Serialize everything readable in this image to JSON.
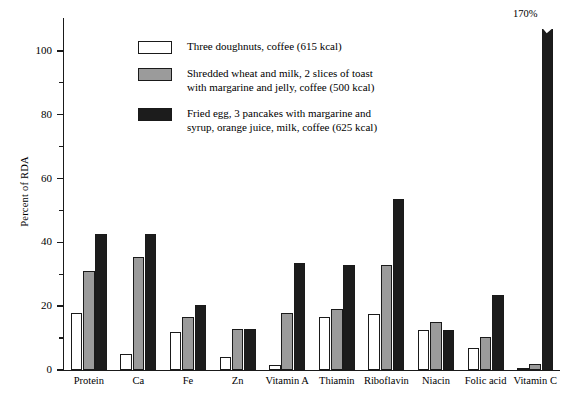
{
  "chart_data": {
    "type": "bar",
    "title": "",
    "xlabel": "",
    "ylabel": "Percent of RDA",
    "ylim": [
      0,
      110
    ],
    "yticks": [
      0,
      20,
      40,
      60,
      80,
      100
    ],
    "ytick_labels": [
      "0",
      "20",
      "40",
      "60",
      "80",
      "100"
    ],
    "yminor_ticks": [
      10,
      30,
      50,
      70,
      90
    ],
    "grid": false,
    "legend_position": "upper-left-inside",
    "categories": [
      "Protein",
      "Ca",
      "Fe",
      "Zn",
      "Vitamin A",
      "Thiamin",
      "Riboflavin",
      "Niacin",
      "Folic acid",
      "Vitamin C"
    ],
    "series": [
      {
        "name": "Three doughnuts, coffee (615 kcal)",
        "color": "#ffffff",
        "values": [
          18,
          5,
          12,
          4,
          1.5,
          16.5,
          17.5,
          12.5,
          7,
          0.5
        ]
      },
      {
        "name": "Shredded wheat and milk, 2 slices of toast with margarine and jelly, coffee (500 kcal)",
        "color": "#9b9b9b",
        "values": [
          31,
          35.5,
          16.5,
          13,
          18,
          19,
          33,
          15,
          10.5,
          2
        ]
      },
      {
        "name": "Fried egg, 3 pancakes with margarine and syrup, orange juice, milk, coffee (625 kcal)",
        "color": "#1c1c1c",
        "values": [
          42.5,
          42.5,
          20.5,
          13,
          33.5,
          33,
          53.5,
          12.5,
          23.5,
          170
        ]
      }
    ],
    "annotations": [
      {
        "text": "170%",
        "category": "Vitamin C",
        "series": "Fried egg, 3 pancakes with margarine and syrup, orange juice, milk, coffee (625 kcal)",
        "note": "bar is truncated with a break notch; actual value exceeds axis maximum"
      }
    ]
  },
  "legend": {
    "items": [
      {
        "swatch": "white",
        "lines": [
          "Three doughnuts, coffee (615 kcal)"
        ]
      },
      {
        "swatch": "gray",
        "lines": [
          "Shredded wheat and milk, 2 slices of toast",
          "with margarine and jelly, coffee (500 kcal)"
        ]
      },
      {
        "swatch": "black",
        "lines": [
          "Fried egg, 3 pancakes with margarine and",
          "syrup, orange juice, milk, coffee (625 kcal)"
        ]
      }
    ]
  },
  "axis": {
    "y_title": "Percent of RDA"
  },
  "colors": {
    "series_1": "#ffffff",
    "series_2": "#9b9b9b",
    "series_3": "#1c1c1c",
    "axis": "#1a1a1a",
    "background": "#ffffff"
  }
}
